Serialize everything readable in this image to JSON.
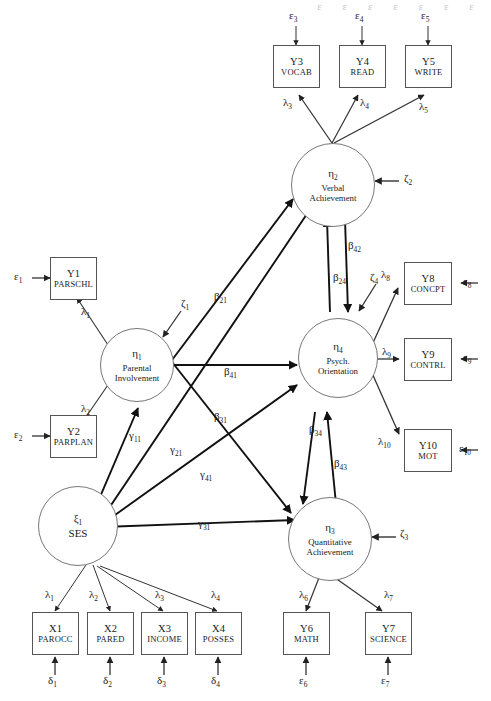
{
  "diagram": {
    "type": "sem-path-diagram",
    "title_cutoff_text": "ε ε ε ε ε ε ε",
    "width": 491,
    "height": 701,
    "observed_variables": [
      {
        "id": "Y3",
        "label": "VOCAB",
        "error": "ε3",
        "loading": "λ3",
        "latent": "η2"
      },
      {
        "id": "Y4",
        "label": "READ",
        "error": "ε4",
        "loading": "λ4",
        "latent": "η2"
      },
      {
        "id": "Y5",
        "label": "WRITE",
        "error": "ε5",
        "loading": "λ5",
        "latent": "η2"
      },
      {
        "id": "Y1",
        "label": "PARSCHL",
        "error": "ε1",
        "loading": "λ1",
        "latent": "η1"
      },
      {
        "id": "Y2",
        "label": "PARPLAN",
        "error": "ε2",
        "loading": "λ2",
        "latent": "η1"
      },
      {
        "id": "Y8",
        "label": "CONCPT",
        "error": "ε8",
        "loading": "λ8",
        "latent": "η4"
      },
      {
        "id": "Y9",
        "label": "CONTRL",
        "error": "ε9",
        "loading": "λ9",
        "latent": "η4"
      },
      {
        "id": "Y10",
        "label": "MOT",
        "error": "ε10",
        "loading": "λ10",
        "latent": "η4"
      },
      {
        "id": "Y6",
        "label": "MATH",
        "error": "ε6",
        "loading": "λ6",
        "latent": "η3"
      },
      {
        "id": "Y7",
        "label": "SCIENCE",
        "error": "ε7",
        "loading": "λ7",
        "latent": "η3"
      },
      {
        "id": "X1",
        "label": "PAROCC",
        "error": "δ1",
        "loading": "λ1",
        "latent": "ξ1"
      },
      {
        "id": "X2",
        "label": "PARED",
        "error": "δ2",
        "loading": "λ2",
        "latent": "ξ1"
      },
      {
        "id": "X3",
        "label": "INCOME",
        "error": "δ3",
        "loading": "λ3",
        "latent": "ξ1"
      },
      {
        "id": "X4",
        "label": "POSSES",
        "error": "δ4",
        "loading": "λ4",
        "latent": "ξ1"
      }
    ],
    "latent_variables": [
      {
        "id": "η1",
        "name_line1": "Parental",
        "name_line2": "Involvement",
        "disturbance": "ζ1"
      },
      {
        "id": "η2",
        "name_line1": "Verbal",
        "name_line2": "Achievement",
        "disturbance": "ζ2"
      },
      {
        "id": "η3",
        "name_line1": "Quantitative",
        "name_line2": "Achievement",
        "disturbance": "ζ3"
      },
      {
        "id": "η4",
        "name_line1": "Psych.",
        "name_line2": "Orientation",
        "disturbance": "ζ4"
      },
      {
        "id": "ξ1",
        "name_line1": "SES",
        "name_line2": "",
        "disturbance": ""
      }
    ],
    "structural_paths": [
      {
        "label": "β21",
        "from": "η1",
        "to": "η2"
      },
      {
        "label": "β31",
        "from": "η1",
        "to": "η3"
      },
      {
        "label": "β41",
        "from": "η1",
        "to": "η4"
      },
      {
        "label": "β42",
        "from": "η4",
        "to": "η2"
      },
      {
        "label": "β24",
        "from": "η2",
        "to": "η4"
      },
      {
        "label": "β34",
        "from": "η4",
        "to": "η3"
      },
      {
        "label": "β43",
        "from": "η3",
        "to": "η4"
      },
      {
        "label": "γ11",
        "from": "ξ1",
        "to": "η1"
      },
      {
        "label": "γ21",
        "from": "ξ1",
        "to": "η2"
      },
      {
        "label": "γ31",
        "from": "ξ1",
        "to": "η3"
      },
      {
        "label": "γ41",
        "from": "ξ1",
        "to": "η4"
      }
    ],
    "disturbance_labels": [
      "ζ1",
      "ζ2",
      "ζ3",
      "ζ4"
    ],
    "colors": {
      "stroke": "#333333",
      "box_border": "#555555",
      "ellipse_border": "#777777",
      "background": "#ffffff"
    }
  }
}
